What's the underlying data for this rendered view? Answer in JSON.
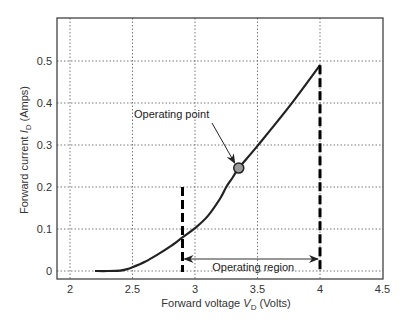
{
  "chart_data": {
    "type": "line",
    "title": "",
    "xlabel": "Forward voltage V_D (Volts)",
    "xlabel_parts": {
      "prefix": "Forward voltage ",
      "var": "V",
      "sub": "D",
      "suffix": " (Volts)"
    },
    "ylabel": "Forward current I_D (Amps)",
    "ylabel_parts": {
      "prefix": "Forward current ",
      "var": "I",
      "sub": "D",
      "suffix": " (Amps)"
    },
    "xlim": [
      1.9,
      4.5
    ],
    "ylim": [
      -0.02,
      0.6
    ],
    "xticks": [
      2,
      2.5,
      3,
      3.5,
      4,
      4.5
    ],
    "xtick_labels": [
      "2",
      "2.5",
      "3",
      "3.5",
      "4",
      "4.5"
    ],
    "yticks": [
      0,
      0.1,
      0.2,
      0.3,
      0.4,
      0.5
    ],
    "ytick_labels": [
      "0",
      "0.1",
      "0.2",
      "0.3",
      "0.4",
      "0.5"
    ],
    "grid": true,
    "legend": null,
    "series": [
      {
        "name": "Diode I-V curve",
        "x": [
          2.2,
          2.3,
          2.4,
          2.45,
          2.5,
          2.6,
          2.7,
          2.8,
          2.9,
          3.0,
          3.1,
          3.2,
          3.25,
          3.3,
          3.35,
          3.5,
          3.75,
          4.0
        ],
        "y": [
          0.0,
          0.0,
          0.001,
          0.004,
          0.009,
          0.022,
          0.039,
          0.058,
          0.08,
          0.102,
          0.13,
          0.172,
          0.2,
          0.222,
          0.245,
          0.298,
          0.39,
          0.49
        ]
      }
    ],
    "operating_point": {
      "x": 3.35,
      "y": 0.245,
      "label": "Operating point"
    },
    "operating_region": {
      "x_start": 2.9,
      "x_end": 4.0,
      "label": "Operating region"
    },
    "boundary_lines": [
      {
        "x": 2.9,
        "y_top": 0.2,
        "style": "dashed"
      },
      {
        "x": 4.0,
        "y_top": 0.49,
        "style": "dashed"
      }
    ]
  },
  "colors": {
    "curve": "#222222",
    "grid": "#555555",
    "frame": "#333333",
    "point_fill": "#9a9a9a",
    "point_stroke": "#222222"
  }
}
